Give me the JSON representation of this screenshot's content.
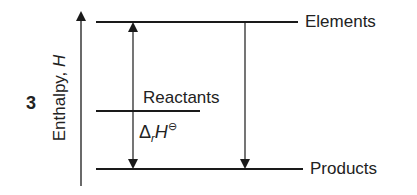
{
  "figure": {
    "number": "3",
    "axis": {
      "label": "Enthalpy, ",
      "variable": "H"
    },
    "levels": [
      {
        "name": "Elements",
        "y": 22
      },
      {
        "name": "Reactants",
        "y": 111
      },
      {
        "name": "Products",
        "y": 169
      }
    ],
    "delta_label": {
      "delta": "Δ",
      "subscript": "r",
      "symbol": "H",
      "superscript": "⊖"
    },
    "colors": {
      "line": "#1a1a1a",
      "background": "#ffffff"
    }
  }
}
